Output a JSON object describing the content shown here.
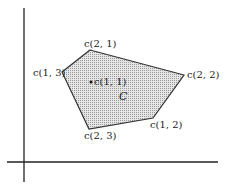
{
  "diagram": {
    "region_label": "C",
    "center": {
      "label": "c(1, 1)",
      "x": 91,
      "y": 82
    },
    "vertices": [
      {
        "label": "c(2, 1)",
        "x": 90,
        "y": 50
      },
      {
        "label": "c(2, 2)",
        "x": 184,
        "y": 75
      },
      {
        "label": "c(1, 2)",
        "x": 153,
        "y": 118
      },
      {
        "label": "c(2, 3)",
        "x": 89,
        "y": 129
      },
      {
        "label": "c(1, 3)",
        "x": 62,
        "y": 72
      }
    ],
    "colors": {
      "fill": "#d8d8d8",
      "stroke": "#333333",
      "axis": "#222222"
    }
  }
}
